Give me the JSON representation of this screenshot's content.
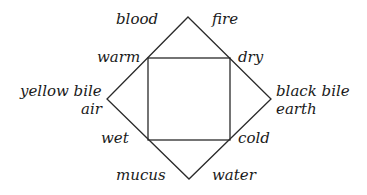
{
  "diagram": {
    "type": "four-humours-diagram",
    "shapes": {
      "diamond": {
        "top": [
          188,
          17
        ],
        "right": [
          271,
          99
        ],
        "bottom": [
          189,
          179
        ],
        "left": [
          107,
          99
        ]
      },
      "square": {
        "x": 148,
        "y": 58,
        "width": 82,
        "height": 82
      }
    },
    "colors": {
      "line": "#2a2a2a",
      "text": "#1a1a1a",
      "background": "#ffffff"
    },
    "labels": {
      "blood": "blood",
      "fire": "fire",
      "warm": "warm",
      "dry": "dry",
      "yellow_bile": "yellow bile",
      "air": "air",
      "black_bile": "black bile",
      "earth": "earth",
      "wet": "wet",
      "cold": "cold",
      "mucus": "mucus",
      "water": "water"
    }
  }
}
